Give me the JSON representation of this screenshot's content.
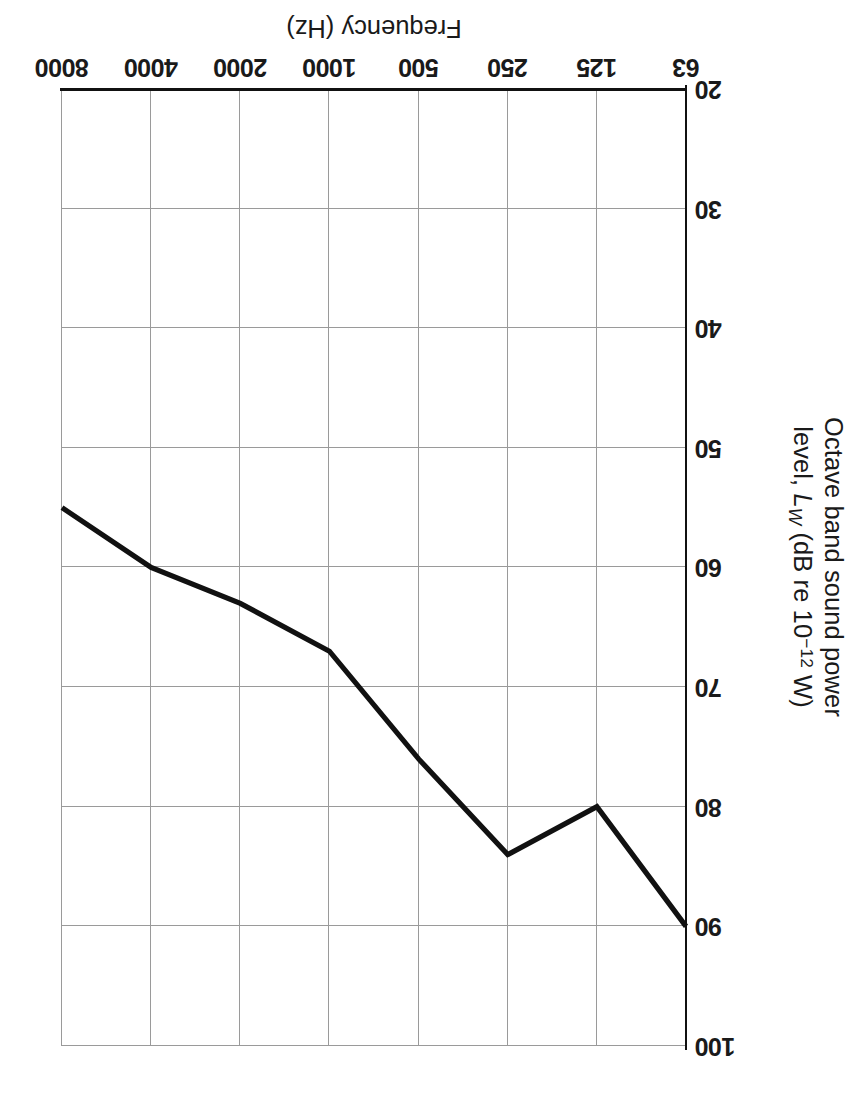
{
  "figure": {
    "orientation": "rotated-180",
    "line_color": "#111111",
    "grid_color": "#9a9a9a"
  },
  "chart_data": {
    "type": "line",
    "title": "",
    "xlabel": "Frequency (Hz)",
    "ylabel": "Octave band sound power level, Lw (dB re 10^-12 W)",
    "ylabel_parts": {
      "line1": "Octave band sound power",
      "line2_pre": "level, ",
      "line2_symbol": "L",
      "line2_symbol_sub": "W",
      "line2_mid": " (dB re 10",
      "line2_exp": "−12",
      "line2_post": " W)"
    },
    "categories": [
      "63",
      "125",
      "250",
      "500",
      "1000",
      "2000",
      "4000",
      "8000"
    ],
    "x_tick_labels": [
      "63",
      "125",
      "250",
      "500",
      "1000",
      "2000",
      "4000",
      "8000"
    ],
    "y_tick_labels": [
      "20",
      "30",
      "40",
      "50",
      "60",
      "70",
      "80",
      "90",
      "100"
    ],
    "y_ticks": [
      20,
      30,
      40,
      50,
      60,
      70,
      80,
      90,
      100
    ],
    "ylim": [
      20,
      100
    ],
    "y_axis_inverted": true,
    "values": [
      90,
      80,
      84,
      76,
      67,
      63,
      60,
      55
    ],
    "grid": true,
    "legend": "none",
    "series": [
      {
        "name": "Octave band sound power level",
        "values": [
          90,
          80,
          84,
          76,
          67,
          63,
          60,
          55
        ]
      }
    ]
  }
}
